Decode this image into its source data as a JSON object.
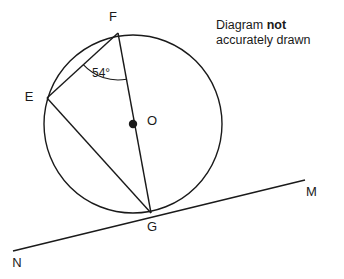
{
  "figure": {
    "kind": "circle-theorem-diagram",
    "note": {
      "line1_prefix": "Diagram ",
      "line1_emphasis": "not",
      "line2": "accurately drawn"
    },
    "angle_label": "54°",
    "points": {
      "E": {
        "label": "E",
        "x": 47,
        "y": 98,
        "label_x": 29,
        "label_y": 98
      },
      "F": {
        "label": "F",
        "x": 118,
        "y": 33,
        "label_x": 113,
        "label_y": 18
      },
      "G": {
        "label": "G",
        "x": 151,
        "y": 213,
        "label_x": 152,
        "label_y": 228
      },
      "O": {
        "label": "O",
        "x": 133,
        "y": 124,
        "label_x": 147,
        "label_y": 122
      },
      "M": {
        "label": "M",
        "x": 305,
        "y": 180,
        "label_x": 306,
        "label_y": 193
      },
      "N": {
        "label": "N",
        "x": 13,
        "y": 251,
        "label_x": 17,
        "label_y": 264
      }
    },
    "circle": {
      "cx": 133,
      "cy": 124,
      "r": 89
    },
    "chords": [
      {
        "name": "chord-FE",
        "from": "F",
        "to": "E"
      },
      {
        "name": "chord-EG",
        "from": "E",
        "to": "G"
      },
      {
        "name": "diameter-FG",
        "from": "F",
        "to": "G"
      }
    ],
    "tangent": {
      "name": "tangent-NM",
      "from": "N",
      "to": "M",
      "touches_at": "G"
    },
    "angle_arc": {
      "vertex": "F",
      "between": [
        "E",
        "G"
      ],
      "value_deg": 54
    },
    "colors": {
      "stroke": "#1a1a1a",
      "fill": "#ffffff",
      "text": "#1a1a1a"
    }
  }
}
